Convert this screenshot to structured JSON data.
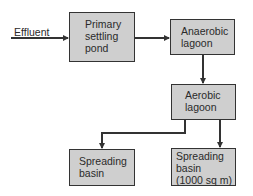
{
  "diagram": {
    "type": "flowchart",
    "input_label": "Effluent",
    "nodes": [
      {
        "id": "primary",
        "label": "Primary\nsettling\npond"
      },
      {
        "id": "anaerobic",
        "label": "Anaerobic\nlagoon"
      },
      {
        "id": "aerobic",
        "label": "Aerobic\nlagoon"
      },
      {
        "id": "spreading1",
        "label": "Spreading\nbasin"
      },
      {
        "id": "spreading2",
        "label": "Spreading\nbasin\n(1000 sq m)"
      }
    ],
    "edges": [
      {
        "from": "Effluent",
        "to": "primary"
      },
      {
        "from": "primary",
        "to": "anaerobic"
      },
      {
        "from": "anaerobic",
        "to": "aerobic"
      },
      {
        "from": "aerobic",
        "to": "spreading1"
      },
      {
        "from": "aerobic",
        "to": "spreading2"
      }
    ],
    "colors": {
      "box_fill": "#cfcfcf",
      "stroke": "#333333"
    }
  }
}
